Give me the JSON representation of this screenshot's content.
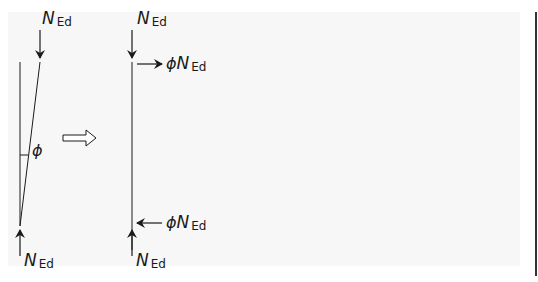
{
  "diagram": {
    "left_member": {
      "top_force": {
        "symbol": "N",
        "subscript": "Ed"
      },
      "bottom_force": {
        "symbol": "N",
        "subscript": "Ed"
      },
      "angle_label": "ϕ"
    },
    "transform_arrow": "⇒",
    "right_member": {
      "top_force": {
        "symbol": "N",
        "subscript": "Ed"
      },
      "bottom_force": {
        "symbol": "N",
        "subscript": "Ed"
      },
      "top_horizontal_force": {
        "prefix": "ϕ",
        "symbol": "N",
        "subscript": "Ed"
      },
      "bottom_horizontal_force": {
        "prefix": "ϕ",
        "symbol": "N",
        "subscript": "Ed"
      }
    },
    "colors": {
      "line": "#1a1a1a",
      "background": "#f7f7f7",
      "rule": "#333333"
    }
  }
}
